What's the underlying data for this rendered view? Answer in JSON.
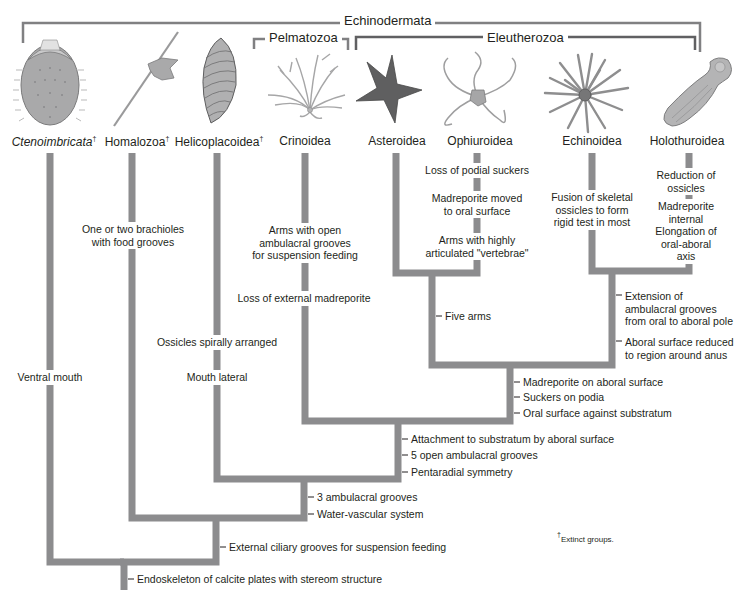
{
  "colors": {
    "branch": "#8c8c8e",
    "bracket": "#808082",
    "text": "#231f20",
    "background": "#ffffff"
  },
  "clades": {
    "echinodermata": "Echinodermata",
    "pelmatozoa": "Pelmatozoa",
    "eleutherozoa": "Eleutherozoa"
  },
  "taxa": [
    {
      "name": "Ctenoimbricata",
      "extinct": true,
      "italic": true,
      "illustration": "ctenoimbricata-illustration"
    },
    {
      "name": "Homalozoa",
      "extinct": true,
      "italic": false,
      "illustration": "homalozoa-illustration"
    },
    {
      "name": "Helicoplacoidea",
      "extinct": true,
      "italic": false,
      "illustration": "helicoplacoid-illustration"
    },
    {
      "name": "Crinoidea",
      "extinct": false,
      "italic": false,
      "illustration": "crinoid-illustration"
    },
    {
      "name": "Asteroidea",
      "extinct": false,
      "italic": false,
      "illustration": "sea-star-illustration"
    },
    {
      "name": "Ophiuroidea",
      "extinct": false,
      "italic": false,
      "illustration": "brittle-star-illustration"
    },
    {
      "name": "Echinoidea",
      "extinct": false,
      "italic": false,
      "illustration": "sea-urchin-illustration"
    },
    {
      "name": "Holothuroidea",
      "extinct": false,
      "italic": false,
      "illustration": "sea-cucumber-illustration"
    }
  ],
  "dagger": "†",
  "branch_characters": {
    "ctenoimbricata": [
      "Ventral mouth"
    ],
    "homalozoa": [
      "One or two brachioles\nwith food grooves"
    ],
    "helicoplacoidea": [
      "Ossicles spirally arranged",
      "Mouth lateral"
    ],
    "crinoidea": [
      "Arms with open\nambulacral grooves\nfor suspension feeding",
      "Loss of external madreporite"
    ],
    "ophiuroidea": [
      "Loss of podial suckers",
      "Madreporite moved\nto oral surface",
      "Arms with highly\narticulated \"vertebrae\""
    ],
    "echinoidea": [
      "Fusion of skeletal\nossicles to form\nrigid test in most"
    ],
    "holothuroidea": [
      "Reduction of\nossicles",
      "Madreporite internal",
      "Elongation of\noral-aboral axis"
    ]
  },
  "node_characters": {
    "asteroidea_ophiuroidea": [
      "Five arms"
    ],
    "echinoidea_holothuroidea": [
      "Extension of\nambulacral grooves\nfrom oral to aboral pole",
      "Aboral surface reduced\nto region around anus"
    ],
    "eleutherozoa": [
      "Madreporite on aboral surface",
      "Suckers on podia",
      "Oral surface against substratum"
    ],
    "pelmatozoa_eleutherozoa": [
      "Attachment to substratum by aboral surface",
      "5 open ambulacral grooves",
      "Pentaradial symmetry"
    ],
    "helicoplacoidea_plus": [
      "3 ambulacral grooves",
      "Water-vascular system"
    ],
    "homalozoa_plus": [
      "External ciliary grooves for suspension feeding"
    ],
    "root": [
      "Endoskeleton of calcite plates with stereom structure"
    ]
  },
  "footnote": "Extinct groups."
}
